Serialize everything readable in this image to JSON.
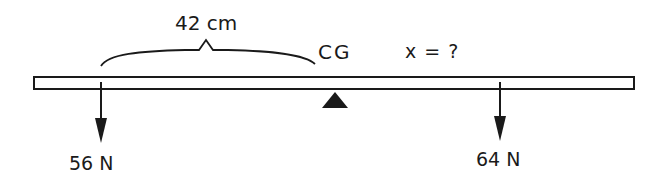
{
  "diagram": {
    "type": "lever / balanced beam force diagram",
    "distance_label": "42 cm",
    "cg_label": "CG",
    "unknown_label": "x = ?",
    "left_force_label": "56 N",
    "right_force_label": "64 N",
    "colors": {
      "stroke": "#1a1a1a",
      "background": "#ffffff"
    }
  }
}
